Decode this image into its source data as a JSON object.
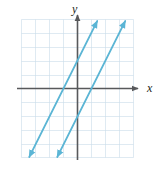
{
  "figure": {
    "width": 162,
    "height": 170,
    "background": "#ffffff"
  },
  "labels": {
    "y_axis": "y",
    "x_axis": "x"
  },
  "style": {
    "grid_color": "#c9dcea",
    "axis_color": "#58595b",
    "line_color": "#5bb5d5",
    "label_color": "#231f20",
    "grid_line_width": 0.6,
    "axis_line_width": 1.6,
    "data_line_width": 1.7
  },
  "chart_data": {
    "type": "line",
    "title": "",
    "xlabel": "x",
    "ylabel": "y",
    "xlim": [
      -4,
      4
    ],
    "ylim": [
      -5,
      5
    ],
    "grid": true,
    "grid_step": 1,
    "legend": "none",
    "axes_arrows": {
      "x_positive": true,
      "y_positive": true
    },
    "series": [
      {
        "name": "line-1",
        "equation": "y = 2x + 2",
        "slope": 2,
        "y_intercept": 2,
        "x_intercept": -1,
        "points": [
          [
            -4,
            -6
          ],
          [
            2,
            6
          ]
        ],
        "arrows_both_ends": true,
        "color": "#5bb5d5"
      },
      {
        "name": "line-2",
        "equation": "y = 2x - 2",
        "slope": 2,
        "y_intercept": -2,
        "x_intercept": 1,
        "points": [
          [
            -2,
            -6
          ],
          [
            4,
            6
          ]
        ],
        "arrows_both_ends": true,
        "color": "#5bb5d5"
      }
    ],
    "relationship": "two parallel lines with equal slope 2"
  }
}
